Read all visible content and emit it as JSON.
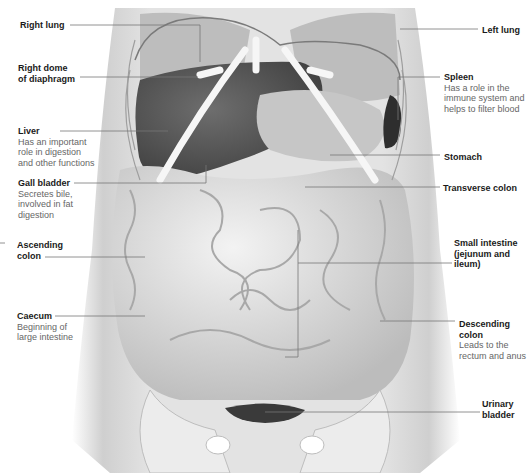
{
  "figure": {
    "type": "anatomical-diagram"
  },
  "labels_left": [
    {
      "id": "right-lung",
      "title": "Right lung",
      "desc": ""
    },
    {
      "id": "right-dome-diaphragm",
      "title": "Right dome of diaphragm",
      "title_lines": [
        "Right dome",
        "of diaphragm"
      ],
      "desc": ""
    },
    {
      "id": "liver",
      "title": "Liver",
      "desc_lines": [
        "Has an important",
        "role in digestion",
        "and other functions"
      ]
    },
    {
      "id": "gall-bladder",
      "title": "Gall bladder",
      "desc_lines": [
        "Secretes bile,",
        "involved in fat",
        "digestion"
      ]
    },
    {
      "id": "ascending-colon",
      "title_lines": [
        "Ascending",
        "colon"
      ],
      "desc": ""
    },
    {
      "id": "caecum",
      "title": "Caecum",
      "desc_lines": [
        "Beginning of",
        "large intestine"
      ]
    }
  ],
  "labels_right": [
    {
      "id": "left-lung",
      "title": "Left lung",
      "desc": ""
    },
    {
      "id": "spleen",
      "title": "Spleen",
      "desc_lines": [
        "Has a role in the",
        "immune system and",
        "helps to filter blood"
      ]
    },
    {
      "id": "stomach",
      "title": "Stomach",
      "desc": ""
    },
    {
      "id": "transverse-colon",
      "title": "Transverse colon",
      "desc": ""
    },
    {
      "id": "small-intestine",
      "title_lines": [
        "Small intestine",
        "(jejunum and",
        "ileum)"
      ],
      "desc": ""
    },
    {
      "id": "descending-colon",
      "title_lines": [
        "Descending",
        "colon"
      ],
      "desc_lines": [
        "Leads to the",
        "rectum and anus"
      ]
    },
    {
      "id": "urinary-bladder",
      "title_lines": [
        "Urinary",
        "bladder"
      ],
      "desc": ""
    }
  ],
  "colors": {
    "label_title": "#1a1a1a",
    "label_desc": "#666666",
    "leader_line": "#777777",
    "body": "#d9d9d9",
    "organ_dark": "#5a5a5a",
    "bone": "#f4f4f4"
  }
}
